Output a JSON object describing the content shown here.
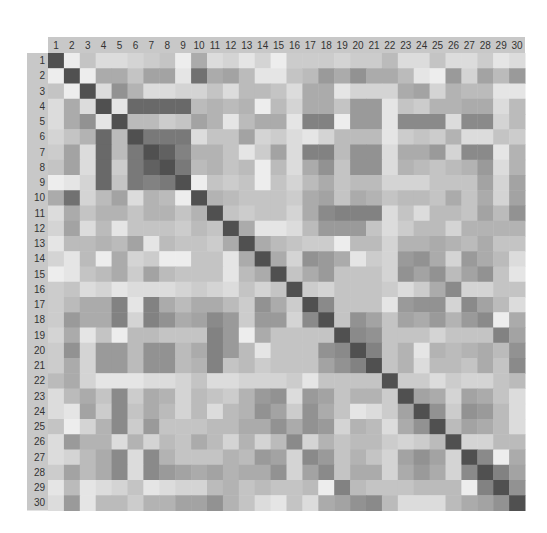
{
  "chart_data": {
    "type": "heatmap",
    "title": "",
    "xlabel": "",
    "ylabel": "",
    "x_tick_labels": [
      "1",
      "2",
      "3",
      "4",
      "5",
      "6",
      "7",
      "8",
      "9",
      "10",
      "11",
      "12",
      "13",
      "14",
      "15",
      "16",
      "17",
      "18",
      "19",
      "20",
      "21",
      "22",
      "23",
      "24",
      "25",
      "26",
      "27",
      "28",
      "29",
      "30"
    ],
    "y_tick_labels": [
      "1",
      "2",
      "3",
      "4",
      "5",
      "6",
      "7",
      "8",
      "9",
      "10",
      "11",
      "12",
      "13",
      "14",
      "15",
      "16",
      "17",
      "18",
      "19",
      "20",
      "21",
      "22",
      "23",
      "24",
      "25",
      "26",
      "27",
      "28",
      "29",
      "30"
    ],
    "value_range": [
      0,
      1
    ],
    "colormap": {
      "low": "#f5f5f5",
      "high": "#505050"
    },
    "header_color": "#c8c8c8",
    "values": [
      [
        1.0,
        0.05,
        0.3,
        0.15,
        0.15,
        0.2,
        0.25,
        0.3,
        0.05,
        0.45,
        0.15,
        0.2,
        0.1,
        0.2,
        0.05,
        0.25,
        0.25,
        0.25,
        0.2,
        0.25,
        0.25,
        0.35,
        0.15,
        0.15,
        0.3,
        0.15,
        0.15,
        0.25,
        0.1,
        0.15
      ],
      [
        0.05,
        1.0,
        0.05,
        0.45,
        0.45,
        0.3,
        0.5,
        0.5,
        0.1,
        0.8,
        0.45,
        0.5,
        0.35,
        0.1,
        0.1,
        0.3,
        0.35,
        0.55,
        0.45,
        0.6,
        0.45,
        0.45,
        0.35,
        0.1,
        0.05,
        0.55,
        0.2,
        0.5,
        0.35,
        0.55
      ],
      [
        0.3,
        0.05,
        1.0,
        0.15,
        0.6,
        0.4,
        0.15,
        0.15,
        0.2,
        0.2,
        0.3,
        0.15,
        0.35,
        0.35,
        0.3,
        0.15,
        0.45,
        0.45,
        0.1,
        0.2,
        0.2,
        0.2,
        0.45,
        0.5,
        0.2,
        0.4,
        0.35,
        0.35,
        0.1,
        0.1
      ],
      [
        0.15,
        0.45,
        0.15,
        1.0,
        0.1,
        0.85,
        0.85,
        0.85,
        0.85,
        0.35,
        0.4,
        0.35,
        0.4,
        0.05,
        0.35,
        0.2,
        0.45,
        0.45,
        0.3,
        0.55,
        0.55,
        0.1,
        0.3,
        0.25,
        0.4,
        0.4,
        0.45,
        0.45,
        0.15,
        0.35
      ],
      [
        0.15,
        0.45,
        0.6,
        0.1,
        1.0,
        0.35,
        0.35,
        0.25,
        0.3,
        0.5,
        0.4,
        0.1,
        0.35,
        0.45,
        0.45,
        0.1,
        0.7,
        0.7,
        0.05,
        0.55,
        0.55,
        0.1,
        0.65,
        0.65,
        0.65,
        0.15,
        0.65,
        0.65,
        0.2,
        0.35
      ],
      [
        0.2,
        0.3,
        0.4,
        0.85,
        0.35,
        1.0,
        0.75,
        0.75,
        0.75,
        0.15,
        0.3,
        0.3,
        0.5,
        0.2,
        0.25,
        0.15,
        0.1,
        0.2,
        0.35,
        0.35,
        0.35,
        0.1,
        0.25,
        0.3,
        0.25,
        0.4,
        0.15,
        0.15,
        0.3,
        0.25
      ],
      [
        0.25,
        0.5,
        0.15,
        0.85,
        0.35,
        0.75,
        1.0,
        0.9,
        0.7,
        0.4,
        0.4,
        0.3,
        0.1,
        0.25,
        0.5,
        0.15,
        0.7,
        0.7,
        0.35,
        0.6,
        0.6,
        0.15,
        0.45,
        0.45,
        0.55,
        0.2,
        0.65,
        0.65,
        0.1,
        0.4
      ],
      [
        0.3,
        0.5,
        0.15,
        0.85,
        0.25,
        0.75,
        0.9,
        1.0,
        0.75,
        0.35,
        0.4,
        0.3,
        0.35,
        0.05,
        0.35,
        0.15,
        0.45,
        0.6,
        0.3,
        0.6,
        0.6,
        0.15,
        0.4,
        0.35,
        0.3,
        0.35,
        0.4,
        0.55,
        0.15,
        0.4
      ],
      [
        0.05,
        0.1,
        0.2,
        0.85,
        0.3,
        0.75,
        0.7,
        0.75,
        1.0,
        0.05,
        0.3,
        0.25,
        0.3,
        0.05,
        0.3,
        0.2,
        0.35,
        0.45,
        0.3,
        0.35,
        0.35,
        0.2,
        0.2,
        0.2,
        0.3,
        0.3,
        0.3,
        0.5,
        0.2,
        0.5
      ],
      [
        0.45,
        0.8,
        0.2,
        0.35,
        0.5,
        0.15,
        0.4,
        0.35,
        0.05,
        1.0,
        0.4,
        0.35,
        0.3,
        0.3,
        0.3,
        0.25,
        0.45,
        0.5,
        0.3,
        0.45,
        0.4,
        0.3,
        0.35,
        0.35,
        0.3,
        0.45,
        0.3,
        0.45,
        0.2,
        0.5
      ],
      [
        0.15,
        0.45,
        0.3,
        0.4,
        0.4,
        0.3,
        0.4,
        0.4,
        0.3,
        0.4,
        1.0,
        0.3,
        0.25,
        0.3,
        0.3,
        0.2,
        0.45,
        0.65,
        0.7,
        0.7,
        0.7,
        0.15,
        0.3,
        0.15,
        0.35,
        0.35,
        0.3,
        0.5,
        0.35,
        0.6
      ],
      [
        0.2,
        0.5,
        0.15,
        0.35,
        0.1,
        0.3,
        0.3,
        0.3,
        0.25,
        0.35,
        0.3,
        1.0,
        0.45,
        0.1,
        0.1,
        0.15,
        0.35,
        0.55,
        0.55,
        0.55,
        0.3,
        0.15,
        0.25,
        0.35,
        0.35,
        0.2,
        0.4,
        0.4,
        0.4,
        0.4
      ],
      [
        0.1,
        0.35,
        0.35,
        0.4,
        0.35,
        0.5,
        0.1,
        0.35,
        0.3,
        0.3,
        0.25,
        0.45,
        1.0,
        0.45,
        0.35,
        0.3,
        0.25,
        0.25,
        0.05,
        0.35,
        0.35,
        0.2,
        0.4,
        0.4,
        0.45,
        0.4,
        0.35,
        0.45,
        0.3,
        0.3
      ],
      [
        0.2,
        0.1,
        0.35,
        0.05,
        0.45,
        0.2,
        0.25,
        0.05,
        0.05,
        0.3,
        0.3,
        0.1,
        0.45,
        1.0,
        0.45,
        0.2,
        0.6,
        0.55,
        0.45,
        0.1,
        0.25,
        0.2,
        0.55,
        0.6,
        0.45,
        0.2,
        0.55,
        0.45,
        0.35,
        0.15
      ],
      [
        0.05,
        0.1,
        0.3,
        0.35,
        0.45,
        0.25,
        0.5,
        0.35,
        0.3,
        0.3,
        0.3,
        0.1,
        0.35,
        0.45,
        1.0,
        0.3,
        0.45,
        0.55,
        0.3,
        0.3,
        0.3,
        0.2,
        0.6,
        0.5,
        0.6,
        0.35,
        0.5,
        0.6,
        0.3,
        0.1
      ],
      [
        0.25,
        0.3,
        0.15,
        0.2,
        0.1,
        0.15,
        0.15,
        0.15,
        0.2,
        0.25,
        0.2,
        0.15,
        0.3,
        0.2,
        0.3,
        1.0,
        0.25,
        0.2,
        0.3,
        0.3,
        0.3,
        0.25,
        0.15,
        0.25,
        0.45,
        0.65,
        0.2,
        0.2,
        0.3,
        0.3
      ],
      [
        0.25,
        0.35,
        0.45,
        0.45,
        0.7,
        0.1,
        0.7,
        0.45,
        0.35,
        0.45,
        0.45,
        0.35,
        0.25,
        0.6,
        0.45,
        0.25,
        1.0,
        0.65,
        0.3,
        0.3,
        0.3,
        0.1,
        0.55,
        0.6,
        0.6,
        0.2,
        0.65,
        0.5,
        0.35,
        0.15
      ],
      [
        0.25,
        0.55,
        0.45,
        0.45,
        0.7,
        0.2,
        0.7,
        0.6,
        0.45,
        0.5,
        0.65,
        0.55,
        0.25,
        0.55,
        0.55,
        0.2,
        0.65,
        1.0,
        0.3,
        0.6,
        0.5,
        0.3,
        0.5,
        0.45,
        0.55,
        0.4,
        0.55,
        0.65,
        0.05,
        0.45
      ],
      [
        0.2,
        0.45,
        0.1,
        0.3,
        0.05,
        0.35,
        0.35,
        0.3,
        0.3,
        0.3,
        0.7,
        0.55,
        0.05,
        0.45,
        0.3,
        0.3,
        0.3,
        0.3,
        1.0,
        0.65,
        0.6,
        0.3,
        0.3,
        0.3,
        0.2,
        0.3,
        0.3,
        0.3,
        0.7,
        0.5
      ],
      [
        0.25,
        0.6,
        0.2,
        0.55,
        0.55,
        0.35,
        0.6,
        0.6,
        0.35,
        0.45,
        0.7,
        0.55,
        0.35,
        0.1,
        0.3,
        0.3,
        0.3,
        0.6,
        0.65,
        1.0,
        0.7,
        0.3,
        0.4,
        0.1,
        0.4,
        0.35,
        0.4,
        0.45,
        0.35,
        0.6
      ],
      [
        0.25,
        0.45,
        0.2,
        0.55,
        0.55,
        0.35,
        0.6,
        0.6,
        0.35,
        0.4,
        0.7,
        0.3,
        0.35,
        0.25,
        0.3,
        0.3,
        0.3,
        0.5,
        0.6,
        0.7,
        1.0,
        0.3,
        0.4,
        0.15,
        0.35,
        0.35,
        0.3,
        0.45,
        0.3,
        0.65
      ],
      [
        0.35,
        0.45,
        0.2,
        0.1,
        0.1,
        0.1,
        0.15,
        0.15,
        0.2,
        0.3,
        0.15,
        0.15,
        0.2,
        0.2,
        0.2,
        0.25,
        0.1,
        0.3,
        0.3,
        0.3,
        0.3,
        1.0,
        0.25,
        0.25,
        0.15,
        0.25,
        0.2,
        0.2,
        0.3,
        0.35
      ],
      [
        0.15,
        0.35,
        0.45,
        0.3,
        0.65,
        0.25,
        0.45,
        0.4,
        0.2,
        0.35,
        0.3,
        0.25,
        0.4,
        0.55,
        0.6,
        0.15,
        0.55,
        0.5,
        0.3,
        0.4,
        0.4,
        0.25,
        1.0,
        0.5,
        0.45,
        0.2,
        0.5,
        0.45,
        0.3,
        0.15
      ],
      [
        0.15,
        0.1,
        0.5,
        0.25,
        0.65,
        0.3,
        0.45,
        0.35,
        0.2,
        0.35,
        0.15,
        0.35,
        0.4,
        0.6,
        0.5,
        0.25,
        0.6,
        0.45,
        0.3,
        0.1,
        0.15,
        0.25,
        0.5,
        1.0,
        0.6,
        0.25,
        0.6,
        0.55,
        0.35,
        0.15
      ],
      [
        0.3,
        0.05,
        0.2,
        0.4,
        0.65,
        0.25,
        0.55,
        0.3,
        0.3,
        0.3,
        0.35,
        0.35,
        0.45,
        0.45,
        0.6,
        0.45,
        0.6,
        0.55,
        0.2,
        0.4,
        0.35,
        0.15,
        0.45,
        0.6,
        1.0,
        0.35,
        0.5,
        0.45,
        0.35,
        0.15
      ],
      [
        0.15,
        0.55,
        0.4,
        0.4,
        0.15,
        0.4,
        0.2,
        0.35,
        0.3,
        0.45,
        0.35,
        0.2,
        0.4,
        0.2,
        0.35,
        0.65,
        0.2,
        0.4,
        0.3,
        0.35,
        0.35,
        0.25,
        0.2,
        0.25,
        0.35,
        1.0,
        0.2,
        0.2,
        0.35,
        0.35
      ],
      [
        0.15,
        0.2,
        0.35,
        0.45,
        0.65,
        0.15,
        0.65,
        0.4,
        0.3,
        0.3,
        0.3,
        0.4,
        0.35,
        0.55,
        0.5,
        0.2,
        0.65,
        0.55,
        0.3,
        0.4,
        0.3,
        0.2,
        0.5,
        0.6,
        0.5,
        0.2,
        1.0,
        0.65,
        0.05,
        0.45
      ],
      [
        0.25,
        0.5,
        0.35,
        0.45,
        0.65,
        0.15,
        0.65,
        0.55,
        0.5,
        0.45,
        0.5,
        0.4,
        0.45,
        0.45,
        0.6,
        0.2,
        0.5,
        0.65,
        0.3,
        0.45,
        0.45,
        0.2,
        0.45,
        0.55,
        0.45,
        0.2,
        0.65,
        1.0,
        0.7,
        0.5
      ],
      [
        0.1,
        0.35,
        0.1,
        0.15,
        0.2,
        0.3,
        0.1,
        0.15,
        0.2,
        0.2,
        0.35,
        0.4,
        0.3,
        0.35,
        0.3,
        0.3,
        0.35,
        0.05,
        0.7,
        0.35,
        0.3,
        0.3,
        0.3,
        0.35,
        0.35,
        0.35,
        0.05,
        0.7,
        1.0,
        0.6
      ],
      [
        0.15,
        0.55,
        0.1,
        0.35,
        0.35,
        0.25,
        0.4,
        0.4,
        0.5,
        0.5,
        0.6,
        0.4,
        0.3,
        0.15,
        0.1,
        0.3,
        0.15,
        0.45,
        0.5,
        0.6,
        0.65,
        0.35,
        0.15,
        0.15,
        0.15,
        0.35,
        0.45,
        0.5,
        0.6,
        1.0
      ]
    ]
  }
}
